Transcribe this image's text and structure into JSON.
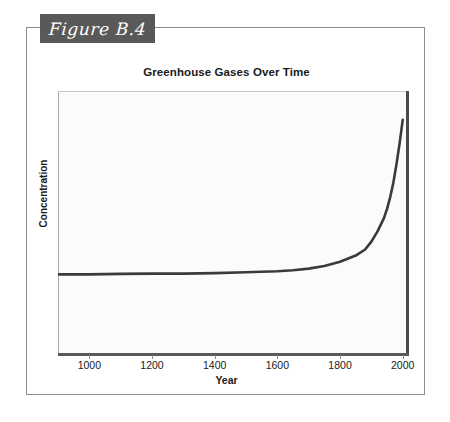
{
  "figure": {
    "banner_label": "Figure B.4",
    "banner_color": "#595959",
    "frame_color": "#8c8c8c"
  },
  "chart_data": {
    "type": "line",
    "title": "Greenhouse Gases Over Time",
    "xlabel": "Year",
    "ylabel": "Concentration",
    "xlim": [
      900,
      2020
    ],
    "ylim": [
      0,
      100
    ],
    "grid": false,
    "legend": null,
    "y_tick_labels": [],
    "x_tick_labels": [
      "1000",
      "1200",
      "1400",
      "1600",
      "1800",
      "2000"
    ],
    "x_ticks": [
      1000,
      1200,
      1400,
      1600,
      1800,
      2000
    ],
    "line_color": "#3a3a3a",
    "series": [
      {
        "name": "Greenhouse gas concentration",
        "x": [
          900,
          1000,
          1100,
          1200,
          1300,
          1400,
          1500,
          1600,
          1650,
          1700,
          1750,
          1800,
          1850,
          1880,
          1900,
          1920,
          1940,
          1950,
          1960,
          1970,
          1980,
          1990,
          2000
        ],
        "values": [
          30,
          30,
          30.2,
          30.3,
          30.3,
          30.5,
          30.8,
          31.2,
          31.6,
          32.2,
          33.2,
          34.8,
          37.2,
          39.5,
          42.5,
          46.5,
          51.5,
          55,
          59.5,
          65,
          72,
          80,
          89
        ]
      }
    ]
  }
}
